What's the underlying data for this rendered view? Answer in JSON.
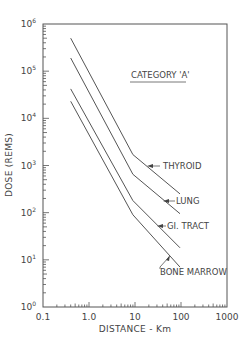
{
  "chart_data": {
    "type": "line",
    "title": "CATEGORY 'A'",
    "xlabel": "DISTANCE - Km",
    "ylabel": "DOSE (REMS)",
    "xscale": "log",
    "yscale": "log",
    "xlim": [
      0.1,
      1000
    ],
    "ylim": [
      1,
      1000000
    ],
    "x_tick_labels": [
      "0.1",
      "1.0",
      "10",
      "100",
      "1000"
    ],
    "x_ticks": [
      0.1,
      1,
      10,
      100,
      1000
    ],
    "y_tick_labels": [
      "10^0",
      "10^1",
      "10^2",
      "10^3",
      "10^4",
      "10^5",
      "10^6"
    ],
    "y_ticks": [
      1,
      10,
      100,
      1000,
      10000,
      100000,
      1000000
    ],
    "grid": false,
    "legend": "inline labels with arrows at right end of each line",
    "series": [
      {
        "name": "THYROID",
        "x": [
          0.4,
          9,
          95
        ],
        "values": [
          500000,
          1700,
          250
        ]
      },
      {
        "name": "LUNG",
        "x": [
          0.4,
          9,
          95
        ],
        "values": [
          190000,
          650,
          95
        ]
      },
      {
        "name": "GI. TRACT",
        "x": [
          0.4,
          9,
          95
        ],
        "values": [
          42000,
          180,
          18
        ]
      },
      {
        "name": "BONE MARROW",
        "x": [
          0.4,
          9,
          95
        ],
        "values": [
          23000,
          90,
          7
        ]
      }
    ]
  },
  "labels": {
    "title": "CATEGORY 'A'",
    "xlabel": "DISTANCE - Km",
    "ylabel": "DOSE (REMS)",
    "x_ticks": [
      "0.1",
      "1.0",
      "10",
      "100",
      "1000"
    ],
    "y_ticks_base": [
      "10",
      "10",
      "10",
      "10",
      "10",
      "10",
      "10"
    ],
    "y_ticks_exp": [
      "0",
      "1",
      "2",
      "3",
      "4",
      "5",
      "6"
    ],
    "series_labels": [
      "THYROID",
      "LUNG",
      "GI. TRACT",
      "BONE MARROW"
    ]
  }
}
